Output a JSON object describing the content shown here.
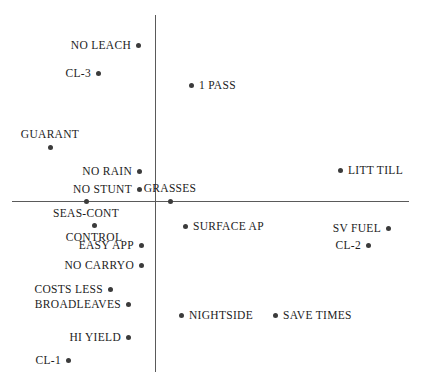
{
  "chart_data": {
    "type": "scatter",
    "title": "",
    "subtitle": "",
    "xlabel": "",
    "ylabel": "",
    "grid": false,
    "legend": null,
    "axes": {
      "horizontal_axis_y": 201,
      "vertical_axis_x": 155,
      "horizontal_axis_x_start": 12,
      "horizontal_axis_x_end": 409,
      "vertical_axis_y_start": 15,
      "vertical_axis_y_end": 372,
      "axis_color": "#5a5a5a"
    },
    "point_color": "#3b3b3b",
    "label_color": "#1c1c1c",
    "points": [
      {
        "label": "NO LEACH",
        "x": 138,
        "y": 45,
        "label_pos": "left"
      },
      {
        "label": "CL-3",
        "x": 98,
        "y": 73,
        "label_pos": "left"
      },
      {
        "label": "1 PASS",
        "x": 191,
        "y": 85,
        "label_pos": "right"
      },
      {
        "label": "GUARANT",
        "x": 50,
        "y": 147,
        "label_pos": "above"
      },
      {
        "label": "NO RAIN",
        "x": 139,
        "y": 171,
        "label_pos": "left"
      },
      {
        "label": "LITT TILL",
        "x": 340,
        "y": 170,
        "label_pos": "right"
      },
      {
        "label": "NO STUNT",
        "x": 139,
        "y": 189,
        "label_pos": "left"
      },
      {
        "label": "GRASSES",
        "x": 170,
        "y": 201,
        "label_pos": "above"
      },
      {
        "label": "SEAS-CONT",
        "x": 86,
        "y": 201,
        "label_pos": "below"
      },
      {
        "label": "SURFACE AP",
        "x": 185,
        "y": 226,
        "label_pos": "right"
      },
      {
        "label": "SV FUEL",
        "x": 388,
        "y": 228,
        "label_pos": "left"
      },
      {
        "label": "CONTROL",
        "x": 94,
        "y": 225,
        "label_pos": "below"
      },
      {
        "label": "EASY APP",
        "x": 141,
        "y": 245,
        "label_pos": "left"
      },
      {
        "label": "CL-2",
        "x": 368,
        "y": 245,
        "label_pos": "left"
      },
      {
        "label": "NO CARRYO",
        "x": 141,
        "y": 265,
        "label_pos": "left"
      },
      {
        "label": "COSTS LESS",
        "x": 110,
        "y": 289,
        "label_pos": "left"
      },
      {
        "label": "BROADLEAVES",
        "x": 128,
        "y": 304,
        "label_pos": "left"
      },
      {
        "label": "NIGHTSIDE",
        "x": 181,
        "y": 315,
        "label_pos": "right"
      },
      {
        "label": "SAVE TIMES",
        "x": 275,
        "y": 315,
        "label_pos": "right"
      },
      {
        "label": "HI YIELD",
        "x": 128,
        "y": 337,
        "label_pos": "left"
      },
      {
        "label": "CL-1",
        "x": 68,
        "y": 360,
        "label_pos": "left"
      }
    ]
  }
}
